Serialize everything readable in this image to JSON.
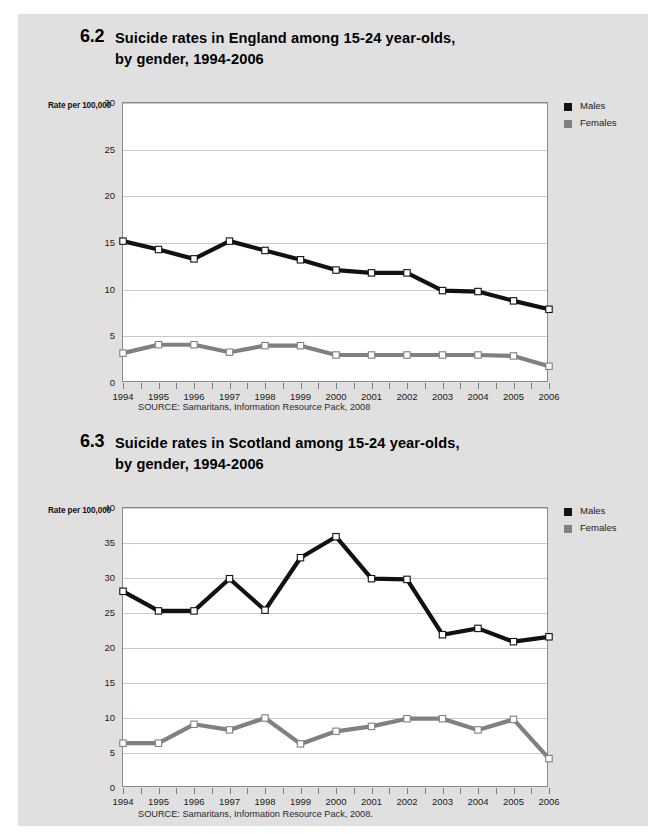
{
  "page": {
    "background": "#e0e0e0",
    "plot_background": "#ffffff"
  },
  "colors": {
    "males": "#111111",
    "females": "#808080",
    "marker_fill": "#ffffff",
    "grid": "#c9c9c9",
    "axis": "#8a8a8a"
  },
  "figures": [
    {
      "id": "england",
      "number": "6.2",
      "title": "Suicide rates in England among 15-24 year-olds, by gender, 1994-2006",
      "title_line1": "Suicide rates in England among 15-24 year-olds,",
      "title_line2": "by gender, 1994-2006",
      "axis_title": "Rate per 100,000",
      "source": "SOURCE: Samaritans, Information Resource Pack, 2008",
      "legend": [
        {
          "label": "Males",
          "color": "#111111"
        },
        {
          "label": "Females",
          "color": "#808080"
        }
      ]
    },
    {
      "id": "scotland",
      "number": "6.3",
      "title": "Suicide rates in Scotland among 15-24 year-olds, by gender, 1994-2006",
      "title_line1": "Suicide rates in Scotland among 15-24 year-olds,",
      "title_line2": "by gender, 1994-2006",
      "axis_title": "Rate per 100,000",
      "source": "SOURCE: Samaritans, Information Resource Pack, 2008.",
      "legend": [
        {
          "label": "Males",
          "color": "#111111"
        },
        {
          "label": "Females",
          "color": "#808080"
        }
      ]
    }
  ],
  "chart_data": [
    {
      "type": "line",
      "id": "england",
      "title": "6.2 Suicide rates in England among 15-24 year-olds, by gender, 1994-2006",
      "xlabel": "",
      "ylabel": "Rate per 100,000",
      "ylim": [
        0,
        30
      ],
      "yticks": [
        0,
        5,
        10,
        15,
        20,
        25,
        30
      ],
      "grid": true,
      "legend_position": "right-top",
      "categories": [
        "1994",
        "1995",
        "1996",
        "1997",
        "1998",
        "1999",
        "2000",
        "2001",
        "2002",
        "2003",
        "2004",
        "2005",
        "2006"
      ],
      "series": [
        {
          "name": "Males",
          "color": "#111111",
          "values": [
            15.2,
            14.3,
            13.3,
            15.2,
            14.2,
            13.2,
            12.1,
            11.8,
            11.8,
            9.9,
            9.8,
            8.8,
            7.9
          ]
        },
        {
          "name": "Females",
          "color": "#808080",
          "values": [
            3.2,
            4.1,
            4.1,
            3.3,
            4.0,
            4.0,
            3.0,
            3.0,
            3.0,
            3.0,
            3.0,
            2.9,
            1.8
          ]
        }
      ],
      "source": "SOURCE: Samaritans, Information Resource Pack, 2008"
    },
    {
      "type": "line",
      "id": "scotland",
      "title": "6.3 Suicide rates in Scotland among 15-24 year-olds, by gender, 1994-2006",
      "xlabel": "",
      "ylabel": "Rate per 100,000",
      "ylim": [
        0,
        40
      ],
      "yticks": [
        0,
        5,
        10,
        15,
        20,
        25,
        30,
        35,
        40
      ],
      "grid": true,
      "legend_position": "right-top",
      "categories": [
        "1994",
        "1995",
        "1996",
        "1997",
        "1998",
        "1999",
        "2000",
        "2001",
        "2002",
        "2003",
        "2004",
        "2005",
        "2006"
      ],
      "series": [
        {
          "name": "Males",
          "color": "#111111",
          "values": [
            28.1,
            25.3,
            25.3,
            29.9,
            25.4,
            32.9,
            35.9,
            29.9,
            29.8,
            21.9,
            22.8,
            20.9,
            21.6
          ]
        },
        {
          "name": "Females",
          "color": "#808080",
          "values": [
            6.4,
            6.4,
            9.1,
            8.3,
            10.0,
            6.3,
            8.1,
            8.8,
            9.9,
            9.9,
            8.3,
            9.8,
            4.2
          ]
        }
      ],
      "source": "SOURCE: Samaritans, Information Resource Pack, 2008."
    }
  ]
}
